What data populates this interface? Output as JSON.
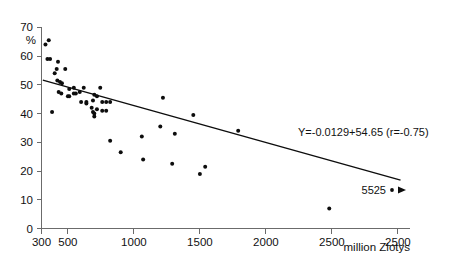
{
  "chart_data": {
    "type": "scatter",
    "title": "",
    "xlabel": "million Zlotys",
    "ylabel": "%",
    "xlim": [
      300,
      2500
    ],
    "ylim": [
      0,
      70
    ],
    "grid": false,
    "legend_position": "none",
    "x_ticks": [
      {
        "value": 300,
        "label": "300"
      },
      {
        "value": 500,
        "label": "500"
      },
      {
        "value": 1000,
        "label": "1000"
      },
      {
        "value": 1500,
        "label": "1500"
      },
      {
        "value": 2000,
        "label": "2000"
      },
      {
        "value": 2500,
        "label": "2500"
      },
      {
        "value": 3000,
        "label": "2500"
      }
    ],
    "y_ticks": [
      {
        "value": 0,
        "label": "0"
      },
      {
        "value": 10,
        "label": "10"
      },
      {
        "value": 20,
        "label": "20"
      },
      {
        "value": 30,
        "label": "30"
      },
      {
        "value": 40,
        "label": "40"
      },
      {
        "value": 50,
        "label": "50"
      },
      {
        "value": 60,
        "label": "60"
      },
      {
        "value": 70,
        "label": "70"
      }
    ],
    "series": [
      {
        "name": "observations",
        "marker": "filled-circle",
        "color": "#0d0d0d",
        "points": [
          [
            330,
            64
          ],
          [
            355,
            65.5
          ],
          [
            345,
            59
          ],
          [
            365,
            59
          ],
          [
            400,
            54
          ],
          [
            425,
            58
          ],
          [
            415,
            55.5
          ],
          [
            480,
            55.5
          ],
          [
            420,
            51.5
          ],
          [
            440,
            51
          ],
          [
            455,
            50.5
          ],
          [
            545,
            49
          ],
          [
            510,
            48.5
          ],
          [
            620,
            49
          ],
          [
            745,
            49
          ],
          [
            430,
            47.5
          ],
          [
            450,
            47
          ],
          [
            545,
            47
          ],
          [
            560,
            47
          ],
          [
            590,
            47.5
          ],
          [
            700,
            46.5
          ],
          [
            720,
            46
          ],
          [
            500,
            46
          ],
          [
            510,
            46
          ],
          [
            600,
            44
          ],
          [
            640,
            44
          ],
          [
            690,
            44.5
          ],
          [
            760,
            44
          ],
          [
            790,
            44
          ],
          [
            820,
            44
          ],
          [
            640,
            43.5
          ],
          [
            680,
            42
          ],
          [
            720,
            41.5
          ],
          [
            760,
            41
          ],
          [
            700,
            40
          ],
          [
            700,
            39
          ],
          [
            690,
            40.5
          ],
          [
            790,
            41
          ],
          [
            1220,
            45.5
          ],
          [
            1450,
            39.5
          ],
          [
            380,
            40.5
          ],
          [
            820,
            30.5
          ],
          [
            900,
            26.5
          ],
          [
            1060,
            32
          ],
          [
            1070,
            24
          ],
          [
            1200,
            35.5
          ],
          [
            1310,
            33
          ],
          [
            1290,
            22.5
          ],
          [
            1500,
            19
          ],
          [
            1540,
            21.5
          ],
          [
            1790,
            34
          ],
          [
            2480,
            7
          ]
        ]
      }
    ],
    "regression": {
      "equation_label": "Y=-0.0129+54.65 (r=-0.75)",
      "slope": -0.0129,
      "intercept": 54.65,
      "r": -0.75,
      "x_start": 310,
      "x_end": 3020
    },
    "annotations": [
      {
        "name": "outlier-label",
        "text": "5525",
        "x": 2870,
        "y": 13,
        "marker": "dot-arrow"
      }
    ]
  }
}
